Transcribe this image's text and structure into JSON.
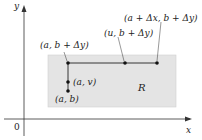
{
  "diagram": {
    "axes": {
      "x_label": "x",
      "y_label": "y",
      "origin_label": "0"
    },
    "region": {
      "label": "R",
      "fill": "#e4e4e4"
    },
    "points": [
      {
        "label": "(a, b + Δy)"
      },
      {
        "label": "(u, b + Δy)"
      },
      {
        "label": "(a + Δx, b + Δy)"
      },
      {
        "label": "(a, v)"
      },
      {
        "label": "(a, b)"
      }
    ]
  }
}
